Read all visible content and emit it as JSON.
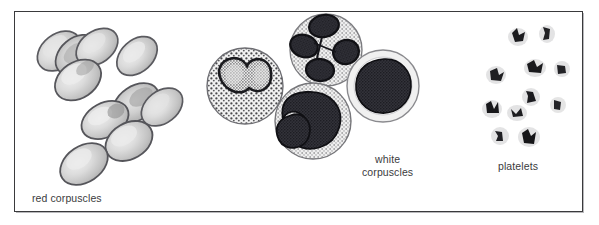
{
  "figure": {
    "kind": "blood-cell-illustration",
    "background_color": "#ffffff",
    "frame_color": "#3a3a3c",
    "text_color": "#3b3b3d",
    "groups": [
      {
        "id": "red-corpuscles",
        "label": "red corpuscles",
        "count": 11,
        "fill_color": "#c9c9c9",
        "outline_color": "#55555a",
        "highlight_color": "#e8e8e8"
      },
      {
        "id": "white-corpuscles",
        "label": "white\ncorpuscles",
        "label_line_1": "white",
        "label_line_2": "corpuscles",
        "count": 4,
        "cytoplasm_color": "#ededed",
        "nucleus_color": "#2e2e30",
        "outline_color": "#6d6d72",
        "cell_types": [
          "granulocyte-bilobed",
          "neutrophil-multilobed",
          "monocyte-kidney-nucleus",
          "lymphocyte-round-nucleus"
        ]
      },
      {
        "id": "platelets",
        "label": "platelets",
        "count": 11,
        "fill_color": "#1f1f21",
        "halo_color": "#d8d8da"
      }
    ]
  }
}
